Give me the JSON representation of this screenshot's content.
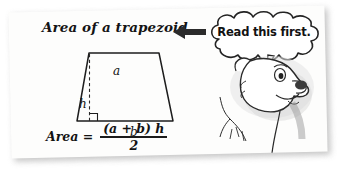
{
  "page": {
    "media": "scanned-textbook-card",
    "background_color": "#ffffff",
    "card_color": "#fdfdfc",
    "ink_color": "#131313"
  },
  "lesson": {
    "title": "Area of a trapezoid",
    "figure": {
      "shape_name": "trapezoid",
      "top_side_label": "a",
      "bottom_side_label": "b",
      "height_label": "h",
      "right_angle_marker": true,
      "height_line_style": "dashed"
    },
    "formula": {
      "label": "Area =",
      "numerator": "(a + b) h",
      "denominator": "2"
    }
  },
  "callout": {
    "arrow_icon": "left-arrow-icon",
    "arrow_direction": "left",
    "bubble_shape": "cloud",
    "bubble_text": "Read this first.",
    "speaker_icon": "bear-head-icon"
  }
}
